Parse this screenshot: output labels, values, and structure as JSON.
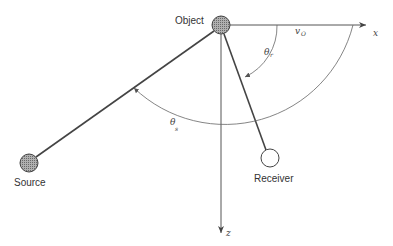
{
  "diagram": {
    "nodes": [
      {
        "id": "object",
        "label": "Object",
        "fill": "hatched-gray"
      },
      {
        "id": "source",
        "label": "Source",
        "fill": "hatched-gray"
      },
      {
        "id": "receiver",
        "label": "Receiver",
        "fill": "white"
      }
    ],
    "axes": {
      "x_label": "x",
      "z_label": "z"
    },
    "annotations": {
      "velocity": {
        "symbol": "v",
        "subscript": "O"
      },
      "theta_r": {
        "symbol": "θ",
        "subscript": "r"
      },
      "theta_s": {
        "symbol": "θ",
        "subscript": "s"
      }
    },
    "edges": [
      {
        "from": "object",
        "to": "source"
      },
      {
        "from": "object",
        "to": "receiver"
      }
    ],
    "colors": {
      "line": "#444444",
      "node_fill": "#9a9a9a",
      "background": "#ffffff"
    }
  }
}
